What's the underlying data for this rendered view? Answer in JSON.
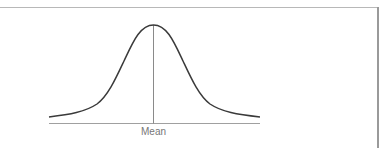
{
  "figure": {
    "type": "normal-distribution-diagram",
    "axis_label": "Mean",
    "colors": {
      "curve": "#3a3a3a",
      "axis": "#999999",
      "mean_line": "#8a8a8a",
      "frame": "#a8a8a8",
      "label": "#777777"
    }
  }
}
